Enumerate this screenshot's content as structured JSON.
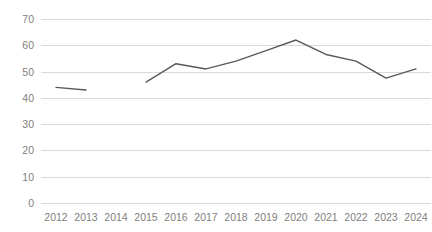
{
  "chart_data": {
    "type": "line",
    "title": "",
    "subtitle": "",
    "xlabel": "",
    "ylabel": "",
    "categories": [
      "2012",
      "2013",
      "2014",
      "2015",
      "2016",
      "2017",
      "2018",
      "2019",
      "2020",
      "2021",
      "2022",
      "2023",
      "2024"
    ],
    "series": [
      {
        "name": "",
        "values": [
          44,
          43,
          null,
          46,
          53,
          51,
          54,
          58,
          62,
          56.5,
          54,
          47.5,
          51
        ],
        "color": "#595959"
      }
    ],
    "ylim": [
      0,
      70
    ],
    "ytick_labels": [
      "0",
      "10",
      "20",
      "30",
      "40",
      "50",
      "60",
      "70"
    ],
    "ytick_values": [
      0,
      10,
      20,
      30,
      40,
      50,
      60,
      70
    ],
    "grid": true,
    "grid_color": "#d9d9d9",
    "legend": false,
    "legend_position": "none",
    "annotations": [],
    "missing_data_years": [
      "2014"
    ],
    "axis_label_color": "#808080",
    "background_color": "#ffffff"
  }
}
